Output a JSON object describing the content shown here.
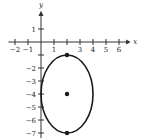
{
  "chart_data": {
    "type": "scatter",
    "title": "",
    "xlabel": "x",
    "ylabel": "y",
    "xlim": [
      -2,
      6.5
    ],
    "ylim": [
      -7.3,
      2
    ],
    "x_ticks": [
      -2,
      -1,
      1,
      2,
      3,
      4,
      5,
      6
    ],
    "x_tick_labels": [
      "−2",
      "−1",
      "1",
      "",
      "3",
      "4",
      "5",
      "6"
    ],
    "y_ticks": [
      1,
      -1,
      -2,
      -3,
      -4,
      -5,
      -6,
      -7
    ],
    "y_tick_labels": [
      "1",
      "",
      "−2",
      "−3",
      "−4",
      "−5",
      "−6",
      "−7"
    ],
    "grid": false,
    "ellipse": {
      "center": [
        2,
        -4
      ],
      "semi_axis_x": 2,
      "semi_axis_y": 3,
      "equation": "(x-2)^2/4 + (y+4)^2/9 = 1"
    },
    "points": [
      {
        "x": 2,
        "y": -1,
        "label": "vertex"
      },
      {
        "x": 2,
        "y": -4,
        "label": "center"
      },
      {
        "x": 2,
        "y": -7,
        "label": "vertex"
      }
    ]
  },
  "axes": {
    "x_label": "x",
    "y_label": "y"
  }
}
